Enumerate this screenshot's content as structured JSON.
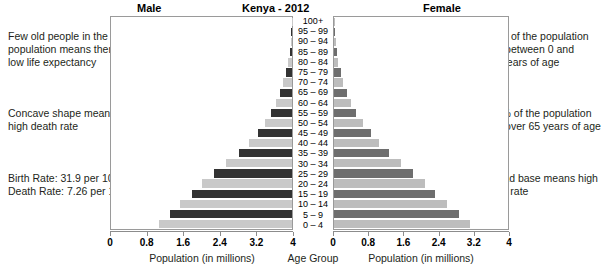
{
  "header": {
    "male_label": "Male",
    "title": "Kenya - 2012",
    "female_label": "Female"
  },
  "annotations": {
    "left": [
      {
        "name": "life-expectancy-note",
        "lines": [
          "Few old people in the",
          "population means there is",
          "low life expectancy"
        ]
      },
      {
        "name": "death-rate-note",
        "lines": [
          "Concave shape means",
          "high death rate"
        ]
      },
      {
        "name": "vital-rates-note",
        "lines": [
          "Birth Rate: 31.9 per 1000",
          "Death Rate: 7.26 per 1000"
        ]
      }
    ],
    "right": [
      {
        "name": "youth-share-note",
        "lines": [
          "42% of the population",
          "are between 0 and",
          "14 years of age"
        ]
      },
      {
        "name": "elderly-share-note",
        "lines": [
          "2.7% of the population",
          "are over 65 years of age"
        ]
      },
      {
        "name": "broad-base-note",
        "lines": [
          "Broad base means high",
          "birth rate"
        ]
      }
    ]
  },
  "axes": {
    "male_title": "Population (in millions)",
    "center_title": "Age Group",
    "female_title": "Population (in millions)",
    "male_ticks": [
      "4",
      "3.2",
      "2.4",
      "1.6",
      "0.8",
      "0"
    ],
    "female_ticks": [
      "0",
      "0.8",
      "1.6",
      "2.4",
      "3.2",
      "4"
    ]
  },
  "colors": {
    "male_dark": "#333333",
    "male_light": "#c9c9c9",
    "female_dark": "#6e6e6e",
    "female_light": "#bdbdbd",
    "frame": "#9a9a9a",
    "text": "#231f20"
  },
  "chart_data": {
    "type": "bar",
    "subtype": "population-pyramid",
    "title": "Kenya - 2012",
    "xlabel": "Population (in millions)",
    "ylabel": "Age Group",
    "xlim": [
      0,
      4
    ],
    "xticks": [
      0,
      0.8,
      1.6,
      2.4,
      3.2,
      4
    ],
    "grid": false,
    "legend": [
      "Male",
      "Female"
    ],
    "legend_position": "top",
    "categories": [
      "100+",
      "95 – 99",
      "90 – 94",
      "85 – 89",
      "80 – 84",
      "75 – 79",
      "70 – 74",
      "65 – 69",
      "60 – 64",
      "55 – 59",
      "50 – 54",
      "45 – 49",
      "40 – 44",
      "35 – 39",
      "30 – 34",
      "25 – 29",
      "20 – 24",
      "15 – 19",
      "10 – 14",
      "5 – 9",
      "0 – 4"
    ],
    "series": [
      {
        "name": "Male",
        "side": "left",
        "values": [
          0.01,
          0.02,
          0.03,
          0.05,
          0.09,
          0.13,
          0.19,
          0.26,
          0.35,
          0.46,
          0.6,
          0.76,
          0.95,
          1.18,
          1.45,
          1.72,
          2.0,
          2.22,
          2.48,
          2.7,
          2.93
        ]
      },
      {
        "name": "Female",
        "side": "right",
        "values": [
          0.01,
          0.02,
          0.04,
          0.06,
          0.1,
          0.15,
          0.21,
          0.29,
          0.39,
          0.51,
          0.66,
          0.84,
          1.04,
          1.27,
          1.55,
          1.82,
          2.1,
          2.32,
          2.6,
          2.87,
          3.13
        ]
      }
    ]
  }
}
